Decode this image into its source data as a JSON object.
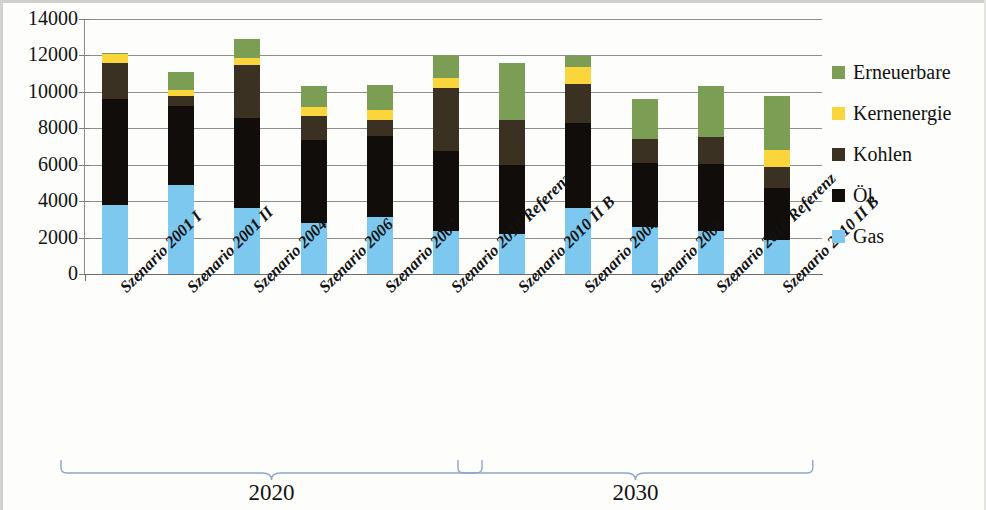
{
  "chart_data": {
    "type": "bar",
    "subtype": "stacked-column",
    "title": "",
    "xlabel": "",
    "ylabel": "",
    "ylim": [
      0,
      14000
    ],
    "ytick_step": 2000,
    "ytick_labels": [
      "0",
      "2000",
      "4000",
      "6000",
      "8000",
      "10000",
      "12000",
      "14000"
    ],
    "grid": true,
    "legend_position": "right",
    "categories": [
      "Szenario 2001 I",
      "Szenario 2001 II",
      "Szenario 2004",
      "Szenario 2006",
      "Szenario 2007",
      "Szenario 2010 Referenz",
      "Szenario 2010 II B",
      "Szenario 2004",
      "Szenario 2006",
      "Szenario 2010 Referenz",
      "Szenario 2010 II B"
    ],
    "series": [
      {
        "name": "Gas",
        "color": "#7CC8EE",
        "values": [
          3800,
          4900,
          3600,
          2800,
          3150,
          2350,
          2200,
          3600,
          2600,
          2350,
          1850
        ]
      },
      {
        "name": "Öl",
        "color": "#110D0B",
        "values": [
          5800,
          4350,
          4950,
          4550,
          4400,
          4400,
          3800,
          4700,
          3500,
          3700,
          2900
        ]
      },
      {
        "name": "Kohlen",
        "color": "#3B3122",
        "values": [
          2000,
          500,
          2950,
          1300,
          900,
          3450,
          2450,
          2150,
          1300,
          1500,
          1150
        ]
      },
      {
        "name": "Kernenergie",
        "color": "#FBD53C",
        "values": [
          500,
          350,
          350,
          500,
          550,
          550,
          0,
          900,
          0,
          0,
          900
        ]
      },
      {
        "name": "Erneuerbare",
        "color": "#7C9E54",
        "values": [
          50,
          1000,
          1050,
          1200,
          1400,
          1300,
          3150,
          600,
          2200,
          2750,
          3000
        ]
      }
    ],
    "totals": [
      12150,
      11100,
      12900,
      10350,
      10400,
      12050,
      11600,
      11950,
      9600,
      10300,
      9800
    ]
  },
  "legend": {
    "items": [
      {
        "label": "Erneuerbare",
        "color": "#7C9E54"
      },
      {
        "label": "Kernenergie",
        "color": "#FBD53C"
      },
      {
        "label": "Kohlen",
        "color": "#3B3122"
      },
      {
        "label": "Öl",
        "color": "#110D0B"
      },
      {
        "label": "Gas",
        "color": "#7CC8EE"
      }
    ]
  },
  "groups": [
    {
      "label": "2020",
      "start_index": 0,
      "end_index": 5
    },
    {
      "label": "2030",
      "start_index": 6,
      "end_index": 10
    }
  ],
  "colors": {
    "gridline": "#8e8e8e",
    "axis": "#6d6d6d",
    "brace": "#8fa5c8",
    "text": "#121212",
    "background": "#fdfdfc"
  }
}
